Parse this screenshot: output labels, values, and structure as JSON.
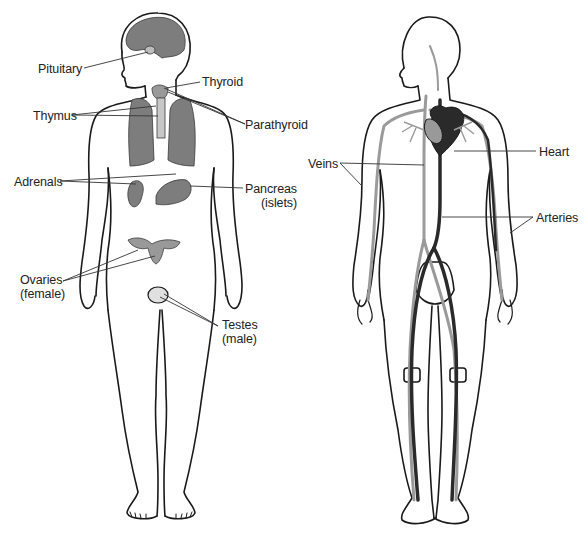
{
  "figure": {
    "left_panel": {
      "name": "Endocrine system",
      "labels": [
        {
          "id": "pituitary",
          "lines": [
            "Pituitary"
          ],
          "x": 38,
          "y": 62
        },
        {
          "id": "thyroid",
          "lines": [
            "Thyroid"
          ],
          "x": 202,
          "y": 75
        },
        {
          "id": "thymus",
          "lines": [
            "Thymus"
          ],
          "x": 33,
          "y": 109
        },
        {
          "id": "parathyroid",
          "lines": [
            "Parathyroid"
          ],
          "x": 245,
          "y": 118
        },
        {
          "id": "adrenals",
          "lines": [
            "Adrenals"
          ],
          "x": 14,
          "y": 175
        },
        {
          "id": "pancreas",
          "lines": [
            "Pancreas",
            "(islets)"
          ],
          "x": 245,
          "y": 182
        },
        {
          "id": "ovaries",
          "lines": [
            "Ovaries",
            "(female)"
          ],
          "x": 20,
          "y": 273
        },
        {
          "id": "testes",
          "lines": [
            "Testes",
            "(male)"
          ],
          "x": 222,
          "y": 318
        }
      ]
    },
    "right_panel": {
      "name": "Circulatory system",
      "labels": [
        {
          "id": "heart",
          "lines": [
            "Heart"
          ],
          "x": 539,
          "y": 145
        },
        {
          "id": "veins",
          "lines": [
            "Veins"
          ],
          "x": 308,
          "y": 157
        },
        {
          "id": "arteries",
          "lines": [
            "Arteries"
          ],
          "x": 536,
          "y": 211
        }
      ]
    }
  },
  "colors": {
    "outline": "#1a1a1a",
    "organ_fill": "#7d7d7d",
    "artery": "#2a2a2a",
    "vein": "#9a9a9a",
    "leader": "#333333"
  }
}
